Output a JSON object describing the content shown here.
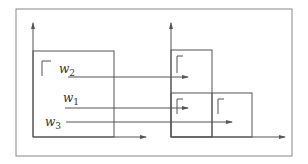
{
  "diagram": {
    "colors": {
      "line": "#555555",
      "frame": "#888888",
      "background": "#ffffff"
    },
    "labels": [
      {
        "id": "w2",
        "base": "w",
        "sub": "2"
      },
      {
        "id": "w1",
        "base": "w",
        "sub": "1"
      },
      {
        "id": "w3",
        "base": "w",
        "sub": "3"
      }
    ],
    "panels": [
      {
        "name": "left-panel",
        "rectangles": 1,
        "corner_marks": 1
      },
      {
        "name": "right-panel",
        "rectangles": 3,
        "corner_marks": 3
      }
    ]
  }
}
